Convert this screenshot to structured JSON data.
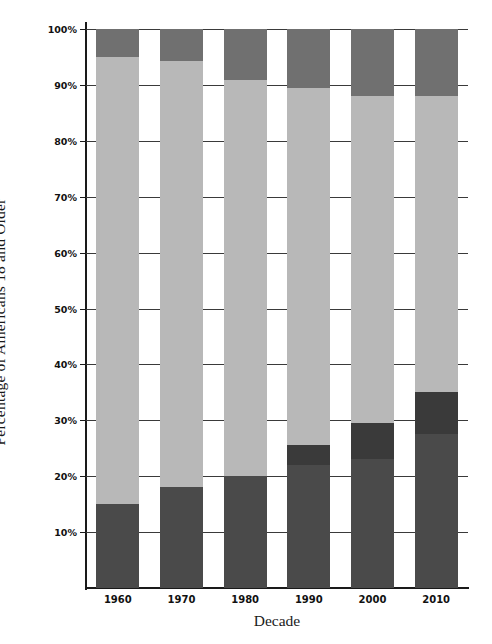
{
  "chart_data": {
    "type": "bar",
    "subtype": "stacked-bar",
    "title": "",
    "xlabel": "Decade",
    "ylabel": "Percentage of Americans 18 and Older",
    "categories": [
      "1960",
      "1970",
      "1980",
      "1990",
      "2000",
      "2010"
    ],
    "ylim": [
      0,
      100
    ],
    "yticks": [
      10,
      20,
      30,
      40,
      50,
      60,
      70,
      80,
      90,
      100
    ],
    "ytick_labels": [
      "10%",
      "20%",
      "30%",
      "40%",
      "50%",
      "60%",
      "70%",
      "80%",
      "90%",
      "100%"
    ],
    "grid": true,
    "legend": "none",
    "series": [
      {
        "name": "bottom-segment",
        "color": "#4a4a4a",
        "values": [
          15.0,
          18.0,
          20.0,
          22.0,
          23.0,
          27.5
        ]
      },
      {
        "name": "second-segment",
        "color": "#3a3a3a",
        "values": [
          0.0,
          0.0,
          0.0,
          3.5,
          6.5,
          7.5
        ]
      },
      {
        "name": "middle-segment",
        "color": "#b8b8b8",
        "values": [
          80.0,
          76.3,
          70.9,
          64.0,
          58.5,
          53.0
        ]
      },
      {
        "name": "top-segment",
        "color": "#707070",
        "values": [
          5.0,
          5.7,
          9.1,
          10.5,
          12.0,
          12.0
        ]
      }
    ],
    "segment_tops": {
      "1960": [
        15.0,
        15.0,
        95.0,
        100.0
      ],
      "1970": [
        18.0,
        18.0,
        94.3,
        100.0
      ],
      "1980": [
        20.0,
        20.0,
        90.9,
        100.0
      ],
      "1990": [
        22.0,
        25.5,
        89.5,
        100.0
      ],
      "2000": [
        23.0,
        29.5,
        88.0,
        100.0
      ],
      "2010": [
        27.5,
        35.0,
        88.0,
        100.0
      ]
    }
  },
  "axes": {
    "y_title": "Percentage of Americans 18 and Older",
    "x_title": "Decade"
  },
  "colors": {
    "bottom": "#4a4a4a",
    "second": "#3a3a3a",
    "middle": "#b8b8b8",
    "top": "#707070",
    "grid": "#3a3a3a",
    "axis": "#1a1a1a",
    "background": "#ffffff"
  }
}
